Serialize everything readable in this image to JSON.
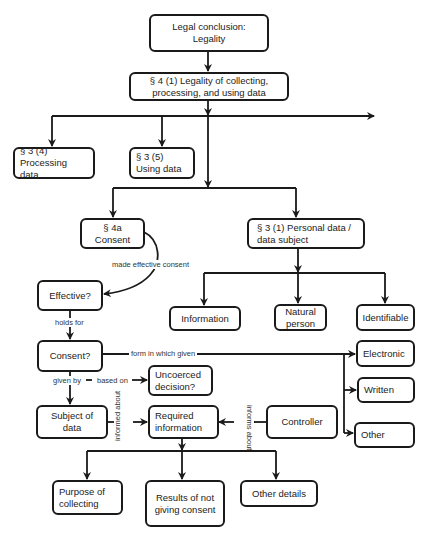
{
  "diagram": {
    "type": "flowchart",
    "nodes": {
      "legal_conclusion": "Legal conclusion: Legality",
      "sec4_1": "§ 4 (1) Legality of collecting, processing, and using data",
      "sec3_4": "§ 3 (4) Processing data",
      "sec3_5": "§ 3 (5) Using data",
      "sec4a": "§ 4a Consent",
      "sec3_1": "§ 3 (1) Personal data / data subject",
      "effective": "Effective?",
      "information": "Information",
      "natural_person": "Natural person",
      "identifiable": "Identifiable",
      "consent": "Consent?",
      "electronic": "Electronic",
      "written": "Written",
      "other": "Other",
      "uncoerced": "Uncoerced decision?",
      "subject_of_data": "Subject of data",
      "required_information": "Required information",
      "controller": "Controller",
      "purpose": "Purpose of collecting",
      "results": "Results of not giving consent",
      "other_details": "Other details"
    },
    "edge_labels": {
      "made_effective": "made effective consent",
      "holds_for": "holds for",
      "form_in_which": "form in which given",
      "given_by": "given by",
      "based_on": "based on",
      "informed_about": "informed about",
      "informs_about": "informs about"
    },
    "edges": [
      {
        "from": "legal_conclusion",
        "to": "sec4_1"
      },
      {
        "from": "sec4_1",
        "to": "sec3_4"
      },
      {
        "from": "sec4_1",
        "to": "sec3_5"
      },
      {
        "from": "sec4_1",
        "to": "(off-page right)"
      },
      {
        "from": "sec4_1",
        "to": "sec4a"
      },
      {
        "from": "sec4_1",
        "to": "sec3_1"
      },
      {
        "from": "sec4a",
        "to": "effective",
        "label": "made effective consent"
      },
      {
        "from": "effective",
        "to": "consent",
        "label": "holds for"
      },
      {
        "from": "sec3_1",
        "to": "information"
      },
      {
        "from": "sec3_1",
        "to": "natural_person"
      },
      {
        "from": "sec3_1",
        "to": "identifiable"
      },
      {
        "from": "consent",
        "to": "electronic",
        "label": "form in which given"
      },
      {
        "from": "consent",
        "to": "written",
        "label": "form in which given"
      },
      {
        "from": "consent",
        "to": "other",
        "label": "form in which given"
      },
      {
        "from": "consent",
        "to": "uncoerced",
        "label": "given by — based on"
      },
      {
        "from": "consent",
        "to": "subject_of_data",
        "label": "given by"
      },
      {
        "from": "subject_of_data",
        "to": "required_information",
        "label": "informed about"
      },
      {
        "from": "controller",
        "to": "required_information",
        "label": "informs about"
      },
      {
        "from": "required_information",
        "to": "purpose"
      },
      {
        "from": "required_information",
        "to": "results"
      },
      {
        "from": "required_information",
        "to": "other_details"
      }
    ]
  },
  "colors": {
    "stroke": "#1a1a1a",
    "background": "#ffffff",
    "text": "#222222"
  }
}
